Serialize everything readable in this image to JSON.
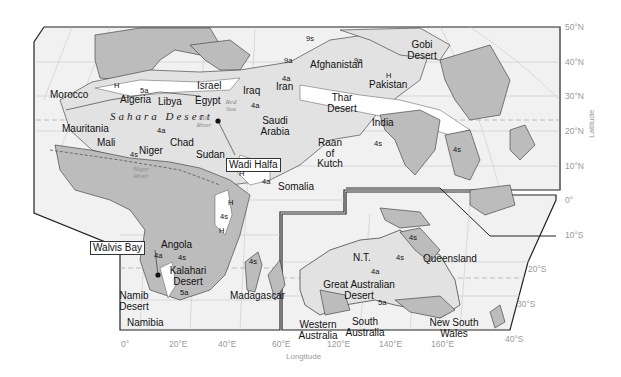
{
  "map": {
    "colors": {
      "background": "#ffffff",
      "ocean": "#f1f1f1",
      "land_semiarid": "#bcbcbc",
      "land_arid": "#e2e2e2",
      "land_hyperarid": "#ffffff",
      "border": "#222222",
      "grid": "#c8c8c8",
      "axis_text": "#9a9a9a"
    },
    "countries": {
      "morocco": "Morocco",
      "algeria": "Algeria",
      "libya": "Libya",
      "egypt": "Egypt",
      "israel": "Israel",
      "iraq": "Iraq",
      "iran": "Iran",
      "afghanistan": "Afghanistan",
      "pakistan": "Pakistan",
      "india": "India",
      "saudi_arabia": "Saudi Arabia",
      "mauritania": "Mauritania",
      "mali": "Mali",
      "niger": "Niger",
      "chad": "Chad",
      "sudan": "Sudan",
      "somalia": "Somalia",
      "angola": "Angola",
      "namibia": "Namibia",
      "madagascar": "Madagascar",
      "nt": "N.T.",
      "queensland": "Queensland",
      "western_australia": "Western Australia",
      "south_australia": "South Australia",
      "new_south_wales": "New South Wales"
    },
    "deserts": {
      "sahara": "Sahara Desert",
      "gobi": "Gobi Desert",
      "thar": "Thar Desert",
      "raan_of_kutch": "Raan of Kutch",
      "kalahari": "Kalahari Desert",
      "namib": "Namib Desert",
      "great_australian": "Great Australian Desert"
    },
    "water": {
      "red_sea": "Red Sea",
      "nile_river": "Nile River",
      "niger_river": "Niger River"
    },
    "callouts": {
      "wadi_halfa": "Wadi Halfa",
      "walvis_bay": "Walvis Bay"
    },
    "zones": {
      "h": "H",
      "z4a": "4a",
      "z4s": "4s",
      "z5a": "5a",
      "z9a": "9a",
      "z9s": "9s"
    },
    "axes": {
      "latitude_title": "Latitude",
      "longitude_title": "Longitude",
      "lat_ticks": [
        "50°N",
        "40°N",
        "30°N",
        "20°N",
        "10°N",
        "0°",
        "10°S"
      ],
      "lat_ticks_australia": [
        "20°S",
        "30°S",
        "40°S"
      ],
      "lon_ticks": [
        "0°",
        "20°E",
        "40°E",
        "60°E",
        "120°E",
        "140°E",
        "160°E"
      ]
    }
  }
}
